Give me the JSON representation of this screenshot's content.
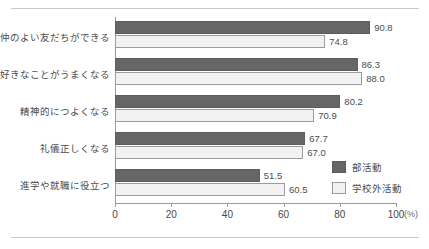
{
  "chart_data": {
    "type": "bar",
    "orientation": "horizontal",
    "title": "",
    "xlabel": "(%)",
    "ylabel": "",
    "xlim": [
      0,
      100
    ],
    "xticks": [
      0,
      20,
      40,
      60,
      80,
      100
    ],
    "xtick_labels": [
      "0",
      "20",
      "40",
      "60",
      "80",
      "100"
    ],
    "axis_unit": "(%)",
    "grid": false,
    "legend_position": "right-lower",
    "categories": [
      "仲のよい友だちができる",
      "好きなことがうまくなる",
      "精神的につよくなる",
      "礼儀正しくなる",
      "進学や就職に役立つ"
    ],
    "series": [
      {
        "name": "部活動",
        "color": "#666666",
        "values": [
          90.8,
          86.3,
          80.2,
          67.7,
          51.5
        ],
        "value_labels": [
          "90.8",
          "86.3",
          "80.2",
          "67.7",
          "51.5"
        ]
      },
      {
        "name": "学校外活動",
        "color": "#f2f2f2",
        "values": [
          74.8,
          88.0,
          70.9,
          67.0,
          60.5
        ],
        "value_labels": [
          "74.8",
          "88.0",
          "70.9",
          "67.0",
          "60.5"
        ]
      }
    ]
  },
  "legend": {
    "items": [
      {
        "label": "部活動"
      },
      {
        "label": "学校外活動"
      }
    ]
  }
}
